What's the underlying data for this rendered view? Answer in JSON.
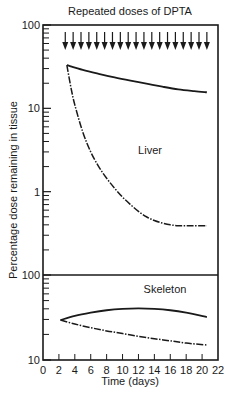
{
  "chart_data": {
    "type": "line",
    "title": "Repeated doses of DPTA",
    "xlabel": "Time (days)",
    "ylabel": "Percentage dose remaining in tissue",
    "xlim": [
      0,
      22
    ],
    "x_ticks": [
      0,
      2,
      4,
      6,
      8,
      10,
      12,
      14,
      16,
      18,
      20,
      22
    ],
    "dose_arrows": {
      "label": "Repeated doses of DPTA",
      "count": 19,
      "x_start": 2.8,
      "x_end": 20.6
    },
    "panels": [
      {
        "name": "Liver",
        "yscale": "log",
        "ylim": [
          0.1,
          100
        ],
        "y_ticks": [
          100,
          10,
          1
        ],
        "series": [
          {
            "name": "liver-solid",
            "style": "solid",
            "x": [
              3,
              5,
              7,
              9,
              11,
              13,
              15,
              17,
              19,
              20.6
            ],
            "y": [
              33,
              29,
              26,
              23.5,
              21.5,
              19.8,
              18.2,
              16.9,
              16.1,
              15.6
            ]
          },
          {
            "name": "liver-dashed",
            "style": "dashed",
            "x": [
              3,
              3.5,
              4,
              5,
              6,
              7,
              8,
              9,
              10,
              11,
              12,
              13,
              14,
              15,
              16,
              17,
              18,
              19,
              20.6
            ],
            "y": [
              33,
              18,
              11,
              5.2,
              3.0,
              2.0,
              1.45,
              1.1,
              0.86,
              0.7,
              0.58,
              0.5,
              0.45,
              0.42,
              0.4,
              0.39,
              0.39,
              0.39,
              0.39
            ]
          }
        ]
      },
      {
        "name": "Skeleton",
        "yscale": "log",
        "ylim": [
          10,
          100
        ],
        "y_ticks": [
          100,
          10
        ],
        "series": [
          {
            "name": "skeleton-solid",
            "style": "solid",
            "x": [
              2.2,
              4,
              6,
              8,
              10,
              12,
              14,
              16,
              18,
              20.6
            ],
            "y": [
              29.5,
              33,
              36,
              38.5,
              40,
              40.5,
              40,
              38.5,
              36,
              32
            ]
          },
          {
            "name": "skeleton-dashed",
            "style": "dashed",
            "x": [
              2.2,
              4,
              6,
              8,
              10,
              12,
              14,
              16,
              18,
              20.6
            ],
            "y": [
              29.5,
              26.5,
              24,
              22,
              20.5,
              19,
              17.8,
              16.8,
              15.8,
              15
            ]
          }
        ]
      }
    ],
    "ink_color": "#1a1a1a",
    "background": "#ffffff"
  }
}
